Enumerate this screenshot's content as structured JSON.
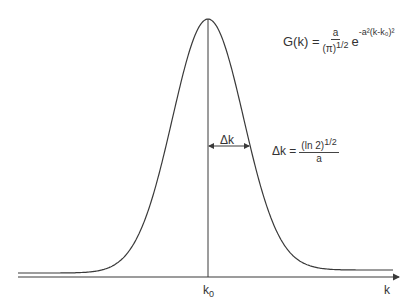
{
  "diagram": {
    "formula": {
      "lhs": "G(k) =",
      "frac_num": "a",
      "frac_den": "(π)",
      "frac_den_exp": "1/2",
      "exp_base": "e",
      "exponent": "-a²(k-k₀)²"
    },
    "width_label": "Δk",
    "width_formula": {
      "lhs": "Δk =",
      "num": "(ln 2)",
      "num_exp": "1/2",
      "den": "a"
    },
    "x_axis": {
      "label": "k",
      "center_tick_label": "k",
      "center_tick_sub": "0"
    },
    "curve": {
      "center_x": 208,
      "baseline_y": 273,
      "peak_y": 19,
      "sigma_px": 35.7,
      "x_start": 18,
      "x_end": 393
    },
    "colors": {
      "line": "#3a3a3a",
      "background": "#ffffff"
    }
  }
}
